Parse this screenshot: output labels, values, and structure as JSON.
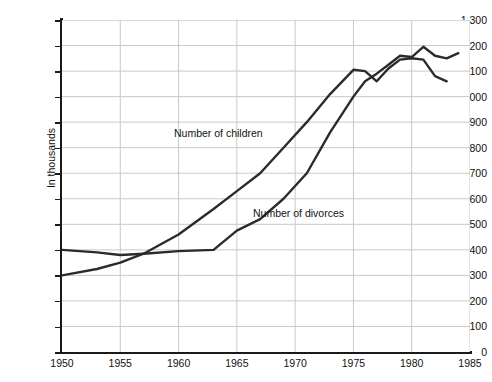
{
  "chart_data": {
    "type": "line",
    "title": "",
    "xlabel": "",
    "ylabel": "In thousands",
    "xlim": [
      1950,
      1985
    ],
    "ylim": [
      0,
      1300
    ],
    "grid": true,
    "legend_position": "inline-annotations",
    "x_ticks": [
      "1950",
      "1955",
      "1960",
      "1965",
      "1970",
      "1975",
      "1980",
      "1985"
    ],
    "x_tick_values": [
      1950,
      1955,
      1960,
      1965,
      1970,
      1975,
      1980,
      1985
    ],
    "y_ticks": [
      "0",
      "100",
      "200",
      "300",
      "400",
      "500",
      "600",
      "700",
      "800",
      "900",
      "1,000",
      "1,100",
      "1,200",
      "1,300"
    ],
    "y_tick_values": [
      0,
      100,
      200,
      300,
      400,
      500,
      600,
      700,
      800,
      900,
      1000,
      1100,
      1200,
      1300
    ],
    "series": [
      {
        "name": "Number of divorces",
        "color": "#2b2b2b",
        "x": [
          1950,
          1953,
          1955,
          1957,
          1960,
          1963,
          1965,
          1967,
          1969,
          1971,
          1973,
          1975,
          1976,
          1977,
          1978,
          1979,
          1980,
          1981,
          1982,
          1983,
          1984
        ],
        "values": [
          400,
          390,
          380,
          385,
          395,
          400,
          475,
          520,
          600,
          700,
          860,
          1000,
          1060,
          1090,
          1125,
          1160,
          1155,
          1195,
          1160,
          1150,
          1170
        ]
      },
      {
        "name": "Number of children",
        "color": "#2b2b2b",
        "x": [
          1950,
          1953,
          1955,
          1957,
          1960,
          1963,
          1965,
          1967,
          1969,
          1971,
          1973,
          1975,
          1976,
          1977,
          1978,
          1979,
          1980,
          1981,
          1982,
          1983
        ],
        "values": [
          300,
          325,
          350,
          385,
          460,
          560,
          630,
          700,
          800,
          900,
          1010,
          1105,
          1100,
          1060,
          1110,
          1145,
          1150,
          1145,
          1080,
          1060
        ]
      }
    ],
    "annotations": [
      {
        "text": "Number of children",
        "x": 1965,
        "y": 840
      },
      {
        "text": "Number of divorces",
        "x": 1971,
        "y": 530
      }
    ]
  }
}
